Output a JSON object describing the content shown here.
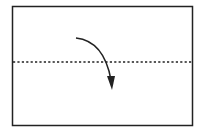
{
  "diagram": {
    "type": "origami-fold-step",
    "paper": {
      "x": 12,
      "y": 6,
      "width": 180,
      "height": 119,
      "stroke": "#222222",
      "fill": "#ffffff"
    },
    "fold_line": {
      "style": "valley-dashed",
      "y": 62,
      "x1": 12,
      "x2": 192,
      "color": "#222222"
    },
    "arrow": {
      "from": [
        76,
        38
      ],
      "control": [
        105,
        42
      ],
      "to": [
        112,
        88
      ],
      "color": "#222222",
      "meaning": "fold-down"
    }
  }
}
